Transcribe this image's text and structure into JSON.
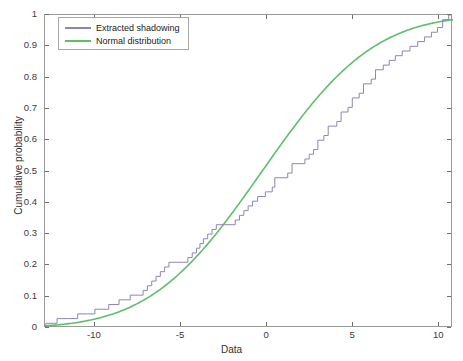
{
  "chart_data": {
    "type": "line",
    "title": "",
    "xlabel": "Data",
    "ylabel": "Cumulative probability",
    "xlim": [
      -12.9,
      10.8
    ],
    "ylim": [
      0,
      1
    ],
    "xticks": [
      -10,
      -5,
      0,
      5,
      10
    ],
    "xticklabels": [
      "-10",
      "-5",
      "0",
      "5",
      "10"
    ],
    "yticks": [
      0,
      0.1,
      0.2,
      0.3,
      0.4,
      0.5,
      0.6,
      0.7,
      0.8,
      0.9,
      1
    ],
    "yticklabels": [
      "0",
      "0.1",
      "0.2",
      "0.3",
      "0.4",
      "0.5",
      "0.6",
      "0.7",
      "0.8",
      "0.9",
      "1"
    ],
    "grid": false,
    "legend_position": "top-left",
    "series": [
      {
        "name": "Extracted shadowing",
        "style": "step",
        "color": "#8b86b8",
        "points": [
          [
            -12.85,
            0.0
          ],
          [
            -12.85,
            0.015
          ],
          [
            -12.2,
            0.015
          ],
          [
            -12.2,
            0.03
          ],
          [
            -11.55,
            0.03
          ],
          [
            -11.55,
            0.03
          ],
          [
            -11.0,
            0.03
          ],
          [
            -11.0,
            0.045
          ],
          [
            -10.45,
            0.045
          ],
          [
            -10.45,
            0.045
          ],
          [
            -10.0,
            0.045
          ],
          [
            -10.0,
            0.06
          ],
          [
            -9.55,
            0.06
          ],
          [
            -9.55,
            0.06
          ],
          [
            -9.2,
            0.06
          ],
          [
            -9.2,
            0.075
          ],
          [
            -8.6,
            0.075
          ],
          [
            -8.6,
            0.09
          ],
          [
            -7.95,
            0.09
          ],
          [
            -7.95,
            0.105
          ],
          [
            -7.55,
            0.105
          ],
          [
            -7.55,
            0.105
          ],
          [
            -7.2,
            0.105
          ],
          [
            -7.2,
            0.12
          ],
          [
            -6.95,
            0.12
          ],
          [
            -6.95,
            0.135
          ],
          [
            -6.7,
            0.135
          ],
          [
            -6.7,
            0.15
          ],
          [
            -6.45,
            0.15
          ],
          [
            -6.45,
            0.165
          ],
          [
            -6.2,
            0.165
          ],
          [
            -6.2,
            0.18
          ],
          [
            -5.95,
            0.18
          ],
          [
            -5.95,
            0.195
          ],
          [
            -5.7,
            0.195
          ],
          [
            -5.7,
            0.21
          ],
          [
            -4.6,
            0.21
          ],
          [
            -4.6,
            0.225
          ],
          [
            -4.35,
            0.225
          ],
          [
            -4.35,
            0.24
          ],
          [
            -4.1,
            0.24
          ],
          [
            -4.1,
            0.255
          ],
          [
            -3.9,
            0.255
          ],
          [
            -3.9,
            0.27
          ],
          [
            -3.7,
            0.27
          ],
          [
            -3.7,
            0.285
          ],
          [
            -3.45,
            0.285
          ],
          [
            -3.45,
            0.3
          ],
          [
            -3.2,
            0.3
          ],
          [
            -3.2,
            0.315
          ],
          [
            -2.95,
            0.315
          ],
          [
            -2.95,
            0.33
          ],
          [
            -1.85,
            0.33
          ],
          [
            -1.85,
            0.345
          ],
          [
            -1.6,
            0.345
          ],
          [
            -1.6,
            0.36
          ],
          [
            -1.35,
            0.36
          ],
          [
            -1.35,
            0.375
          ],
          [
            -1.1,
            0.375
          ],
          [
            -1.1,
            0.39
          ],
          [
            -0.85,
            0.39
          ],
          [
            -0.85,
            0.405
          ],
          [
            -0.55,
            0.405
          ],
          [
            -0.55,
            0.42
          ],
          [
            -0.1,
            0.42
          ],
          [
            -0.1,
            0.435
          ],
          [
            0.3,
            0.435
          ],
          [
            0.3,
            0.45
          ],
          [
            0.45,
            0.45
          ],
          [
            0.45,
            0.48
          ],
          [
            1.2,
            0.48
          ],
          [
            1.2,
            0.495
          ],
          [
            1.45,
            0.495
          ],
          [
            1.45,
            0.525
          ],
          [
            2.2,
            0.525
          ],
          [
            2.2,
            0.54
          ],
          [
            2.45,
            0.54
          ],
          [
            2.45,
            0.555
          ],
          [
            2.7,
            0.555
          ],
          [
            2.7,
            0.57
          ],
          [
            2.95,
            0.57
          ],
          [
            2.95,
            0.6
          ],
          [
            3.3,
            0.6
          ],
          [
            3.3,
            0.615
          ],
          [
            3.55,
            0.615
          ],
          [
            3.55,
            0.645
          ],
          [
            4.05,
            0.645
          ],
          [
            4.05,
            0.66
          ],
          [
            4.3,
            0.66
          ],
          [
            4.3,
            0.69
          ],
          [
            4.7,
            0.69
          ],
          [
            4.7,
            0.705
          ],
          [
            4.95,
            0.705
          ],
          [
            4.95,
            0.735
          ],
          [
            5.35,
            0.735
          ],
          [
            5.35,
            0.75
          ],
          [
            5.6,
            0.75
          ],
          [
            5.6,
            0.78
          ],
          [
            6.05,
            0.78
          ],
          [
            6.05,
            0.795
          ],
          [
            6.3,
            0.795
          ],
          [
            6.3,
            0.825
          ],
          [
            6.75,
            0.825
          ],
          [
            6.75,
            0.84
          ],
          [
            7.1,
            0.84
          ],
          [
            7.1,
            0.855
          ],
          [
            7.45,
            0.855
          ],
          [
            7.45,
            0.87
          ],
          [
            7.85,
            0.87
          ],
          [
            7.85,
            0.885
          ],
          [
            8.3,
            0.885
          ],
          [
            8.3,
            0.9
          ],
          [
            8.75,
            0.9
          ],
          [
            8.75,
            0.915
          ],
          [
            9.15,
            0.915
          ],
          [
            9.15,
            0.93
          ],
          [
            9.55,
            0.93
          ],
          [
            9.55,
            0.945
          ],
          [
            9.9,
            0.945
          ],
          [
            9.9,
            0.96
          ],
          [
            10.2,
            0.96
          ],
          [
            10.2,
            0.985
          ],
          [
            10.55,
            0.985
          ],
          [
            10.55,
            1.0
          ],
          [
            10.75,
            1.0
          ]
        ]
      },
      {
        "name": "Normal distribution",
        "style": "smooth",
        "color": "#5fbf69",
        "distribution": "normal",
        "mean": -0.3,
        "sigma": 5.1,
        "points": [
          [
            -12.85,
            0.006
          ],
          [
            -12.0,
            0.01
          ],
          [
            -11.0,
            0.017
          ],
          [
            -10.0,
            0.027
          ],
          [
            -9.0,
            0.041
          ],
          [
            -8.0,
            0.061
          ],
          [
            -7.0,
            0.088
          ],
          [
            -6.0,
            0.123
          ],
          [
            -5.0,
            0.166
          ],
          [
            -4.0,
            0.219
          ],
          [
            -3.0,
            0.281
          ],
          [
            -2.0,
            0.349
          ],
          [
            -1.0,
            0.424
          ],
          [
            0.0,
            0.5
          ],
          [
            1.0,
            0.576
          ],
          [
            2.0,
            0.649
          ],
          [
            3.0,
            0.716
          ],
          [
            4.0,
            0.776
          ],
          [
            5.0,
            0.827
          ],
          [
            6.0,
            0.868
          ],
          [
            7.0,
            0.901
          ],
          [
            8.0,
            0.927
          ],
          [
            9.0,
            0.947
          ],
          [
            10.0,
            0.961
          ],
          [
            10.8,
            0.97
          ]
        ]
      }
    ],
    "legend": [
      {
        "label": "Extracted shadowing",
        "color": "#8b86b8"
      },
      {
        "label": "Normal distribution",
        "color": "#5fbf69"
      }
    ]
  }
}
